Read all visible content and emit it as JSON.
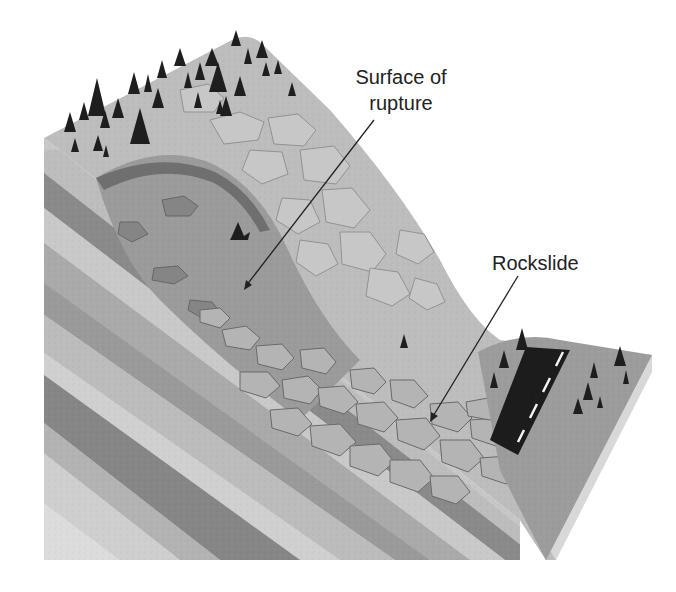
{
  "diagram": {
    "type": "geologic block diagram",
    "colors": {
      "background": "#ffffff",
      "surface_light": "#cfcfcf",
      "surface_mid": "#a9a9a9",
      "scar_dark": "#7d7d7d",
      "road": "#1c1c1c",
      "road_dash": "#f2f2f2",
      "trees": "#1e1e1e",
      "leader_line": "#222222",
      "strata": [
        "#bdbdbd",
        "#8a8a8a",
        "#c9c9c9",
        "#9a9a9a",
        "#d6d6d6",
        "#7f7f7f",
        "#b5b5b5",
        "#a1a1a1",
        "#dcdcdc"
      ]
    }
  },
  "labels": [
    {
      "id": "rupture",
      "lines": [
        "Surface of",
        "rupture"
      ]
    },
    {
      "id": "rockslide",
      "lines": [
        "Rockslide"
      ]
    }
  ],
  "features": {
    "trees": "conifer-icon cluster on hilltop and near road",
    "road": "two-lane road with dashed center line at slope base",
    "boulders": "rockslide debris pile at base of scar"
  }
}
